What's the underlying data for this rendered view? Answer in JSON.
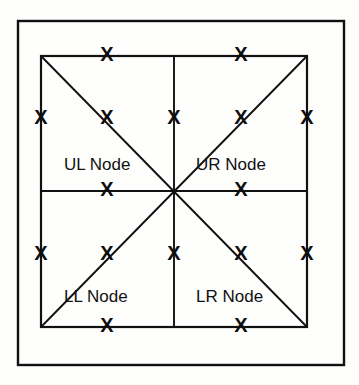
{
  "figure": {
    "background_color": "#fefefd",
    "line_color": "#111111",
    "marker_glyph": "X",
    "marker_color": "#0d0d0d",
    "outer_frame": {
      "name": "outer-border",
      "x": 18,
      "y": 21,
      "width": 326,
      "height": 344,
      "stroke_width": 2.4
    },
    "inner_square": {
      "name": "inner-square",
      "x": 41,
      "y": 56,
      "width": 266,
      "height": 271,
      "stroke_width": 2.2
    },
    "center": {
      "x": 174,
      "y": 191
    },
    "divider_lines": [
      {
        "name": "vertical-divider",
        "x1": 174,
        "y1": 56,
        "x2": 174,
        "y2": 327
      },
      {
        "name": "horizontal-divider",
        "x1": 41,
        "y1": 191,
        "x2": 307,
        "y2": 191
      },
      {
        "name": "diagonal-nw-se",
        "x1": 41,
        "y1": 56,
        "x2": 307,
        "y2": 327
      },
      {
        "name": "diagonal-sw-ne",
        "x1": 41,
        "y1": 327,
        "x2": 307,
        "y2": 56
      }
    ],
    "quadrant_labels": [
      {
        "key": "ul",
        "text": "UL Node",
        "x": 64,
        "y": 170
      },
      {
        "key": "ur",
        "text": "UR Node",
        "x": 196,
        "y": 170
      },
      {
        "key": "ll",
        "text": "LL Node",
        "x": 64,
        "y": 302
      },
      {
        "key": "lr",
        "text": "LR Node",
        "x": 196,
        "y": 302
      }
    ],
    "markers": [
      {
        "id": "top-ul",
        "x": 107,
        "y": 56
      },
      {
        "id": "top-ur",
        "x": 241,
        "y": 56
      },
      {
        "id": "left-upper",
        "x": 41,
        "y": 119
      },
      {
        "id": "ul-interior",
        "x": 107,
        "y": 119
      },
      {
        "id": "mid-top-center",
        "x": 174,
        "y": 119
      },
      {
        "id": "ur-interior",
        "x": 241,
        "y": 119
      },
      {
        "id": "right-upper",
        "x": 307,
        "y": 119
      },
      {
        "id": "mid-left",
        "x": 107,
        "y": 191
      },
      {
        "id": "mid-right",
        "x": 241,
        "y": 191
      },
      {
        "id": "left-lower",
        "x": 41,
        "y": 255
      },
      {
        "id": "ll-interior",
        "x": 107,
        "y": 255
      },
      {
        "id": "mid-bottom-center",
        "x": 174,
        "y": 255
      },
      {
        "id": "lr-interior",
        "x": 241,
        "y": 255
      },
      {
        "id": "right-lower",
        "x": 307,
        "y": 255
      },
      {
        "id": "bottom-ll",
        "x": 107,
        "y": 327
      },
      {
        "id": "bottom-lr",
        "x": 241,
        "y": 327
      }
    ]
  }
}
